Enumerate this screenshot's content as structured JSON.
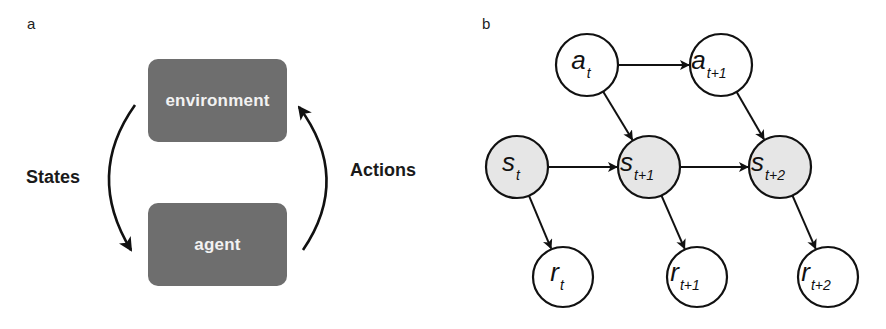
{
  "panel_a": {
    "label": "a",
    "environment_box": {
      "label": "environment",
      "fill": "#6e6e6e"
    },
    "agent_box": {
      "label": "agent",
      "fill": "#6e6e6e"
    },
    "left_arrow_label": "States",
    "right_arrow_label": "Actions"
  },
  "panel_b": {
    "label": "b",
    "node_stroke": "#111111",
    "state_fill": "#e6e6e6",
    "plain_fill": "#ffffff",
    "nodes": [
      {
        "id": "a_t",
        "main": "a",
        "sub": "t",
        "type": "action",
        "cx": 587,
        "cy": 65,
        "r": 31
      },
      {
        "id": "a_t1",
        "main": "a",
        "sub": "t+1",
        "type": "action",
        "cx": 721,
        "cy": 65,
        "r": 31
      },
      {
        "id": "s_t",
        "main": "s",
        "sub": "t",
        "type": "state",
        "cx": 517,
        "cy": 167,
        "r": 31
      },
      {
        "id": "s_t1",
        "main": "s",
        "sub": "t+1",
        "type": "state",
        "cx": 649,
        "cy": 167,
        "r": 31
      },
      {
        "id": "s_t2",
        "main": "s",
        "sub": "t+2",
        "type": "state",
        "cx": 780,
        "cy": 167,
        "r": 31
      },
      {
        "id": "r_t",
        "main": "r",
        "sub": "t",
        "type": "reward",
        "cx": 563,
        "cy": 277,
        "r": 30
      },
      {
        "id": "r_t1",
        "main": "r",
        "sub": "t+1",
        "type": "reward",
        "cx": 697,
        "cy": 277,
        "r": 30
      },
      {
        "id": "r_t2",
        "main": "r",
        "sub": "t+2",
        "type": "reward",
        "cx": 828,
        "cy": 277,
        "r": 30
      }
    ],
    "edges": [
      {
        "from": "a_t",
        "to": "a_t1"
      },
      {
        "from": "a_t",
        "to": "s_t1"
      },
      {
        "from": "a_t1",
        "to": "s_t2"
      },
      {
        "from": "s_t",
        "to": "s_t1"
      },
      {
        "from": "s_t1",
        "to": "s_t2"
      },
      {
        "from": "s_t",
        "to": "r_t"
      },
      {
        "from": "s_t1",
        "to": "r_t1"
      },
      {
        "from": "s_t2",
        "to": "r_t2"
      }
    ]
  }
}
